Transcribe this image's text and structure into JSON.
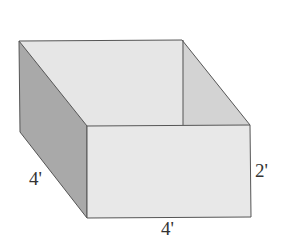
{
  "figure": {
    "type": "open-box-rectangular-prism",
    "colors": {
      "back_wall": "#e6e6e6",
      "front_face": "#e8e8e8",
      "left_face": "#a9a9a9",
      "inner_right_face": "#d3d3d3",
      "edge": "#555555"
    },
    "dimensions": {
      "depth_label": "4'",
      "width_label": "4'",
      "height_label": "2'"
    }
  }
}
